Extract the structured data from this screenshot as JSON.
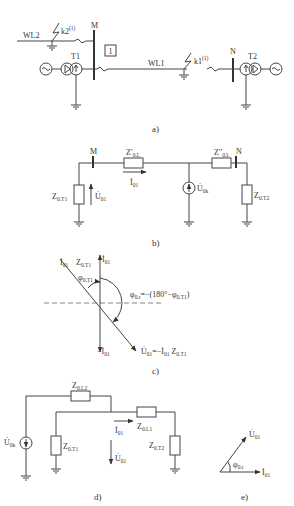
{
  "figure": {
    "a": {
      "caption": "a)",
      "labels": {
        "wl2": "WL2",
        "k2": "k2",
        "k2_sup": "(1)",
        "m": "M",
        "t1": "T1",
        "protection": "1",
        "wl1": "WL1",
        "k1": "k1",
        "k1_sup": "(1)",
        "n": "N",
        "t2": "T2"
      }
    },
    "b": {
      "caption": "b)",
      "labels": {
        "m": "M",
        "n": "N",
        "z0l_prime": "Z′",
        "z0l_prime_sub": "0.L",
        "z0l_dprime": "Z″",
        "z0l_dprime_sub": "0.L",
        "i01": "İ",
        "i01_sub": "01",
        "u01": "U̇",
        "u01_sub": "01",
        "u0k": "U̇",
        "u0k_sub": "0k",
        "z0t1": "Z",
        "z0t1_sub": "0.T1",
        "z0t2": "Z",
        "z0t2_sub": "0.T2"
      }
    },
    "c": {
      "caption": "c)",
      "labels": {
        "i01_top": "İ",
        "i01_sub": "01",
        "z0t1_i01": "Z",
        "z0t1_sub": "0.T1",
        "phi_t1": "φ",
        "phi_t1_sub": "0.T1",
        "phi_r_expr": "φ",
        "phi_r_sub": "0.r",
        "phi_r_rhs": "=−(180°−φ",
        "phi_r_rhs_sub": "0.T1",
        "phi_r_close": ")",
        "neg_i01": "−İ",
        "neg_i01_sub": "01",
        "u01_expr": "U̇",
        "u01_sub": "01",
        "u01_rhs": "=−İ",
        "u01_rhs_sub": "01",
        "u01_z": " Z",
        "u01_z_sub": "0.T1"
      }
    },
    "d": {
      "caption": "d)",
      "labels": {
        "z0l2": "Z",
        "z0l2_sub": "0.L2",
        "z0l1": "Z",
        "z0l1_sub": "0.L1",
        "i01": "İ",
        "i01_sub": "01",
        "u01": "U̇",
        "u01_sub": "01",
        "u0k": "U̇",
        "u0k_sub": "0k",
        "z0t1": "Z",
        "z0t1_sub": "0.T1",
        "z0t2": "Z",
        "z0t2_sub": "0.T2"
      }
    },
    "e": {
      "caption": "e)",
      "labels": {
        "u01": "U̇",
        "u01_sub": "01",
        "i01": "İ",
        "i01_sub": "01",
        "phi": "φ",
        "phi_sub": "0.r"
      }
    }
  }
}
